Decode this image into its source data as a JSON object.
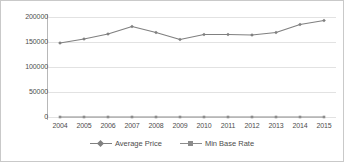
{
  "chart_data": {
    "type": "line",
    "title": "",
    "xlabel": "",
    "ylabel": "",
    "categories": [
      "2004",
      "2005",
      "2006",
      "2007",
      "2008",
      "2009",
      "2010",
      "2011",
      "2012",
      "2013",
      "2014",
      "2015"
    ],
    "series": [
      {
        "name": "Average Price",
        "color": "#808080",
        "marker": "diamond",
        "values": [
          148000,
          156000,
          166000,
          181000,
          169000,
          155000,
          165000,
          165000,
          164000,
          169000,
          185000,
          193000
        ]
      },
      {
        "name": "Min Base Rate",
        "color": "#8c8c8c",
        "marker": "square",
        "values": [
          0,
          0,
          0,
          0,
          0,
          0,
          0,
          0,
          0,
          0,
          0,
          0
        ]
      }
    ],
    "ylim": [
      0,
      200000
    ],
    "yticks": [
      0,
      50000,
      100000,
      150000,
      200000
    ],
    "ytick_labels": [
      "0",
      "50000",
      "100000",
      "150000",
      "200000"
    ],
    "grid": true,
    "grid_color": "#e2e2e2",
    "legend_position": "bottom",
    "axis_color": "#b8b8b8",
    "border_color": "#c9c9c9",
    "background": "#ffffff",
    "text_color": "#4d4d4d"
  }
}
